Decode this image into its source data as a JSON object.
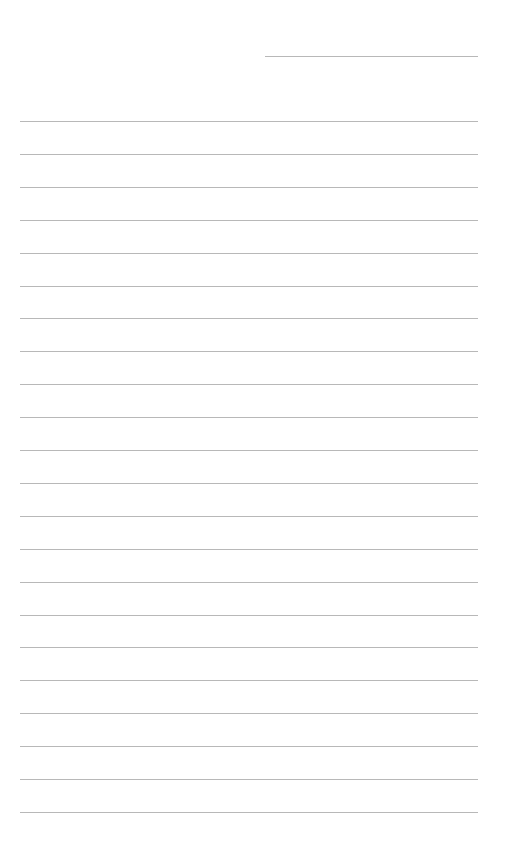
{
  "page": {
    "type": "lined-paper",
    "background": "#ffffff",
    "line_color": "#b8b8b8",
    "header_line": {
      "x1": 265,
      "x2": 478,
      "y": 56
    },
    "ruled_lines": {
      "count": 22,
      "x1": 20,
      "x2": 478,
      "first_y": 121,
      "last_y": 812
    }
  }
}
